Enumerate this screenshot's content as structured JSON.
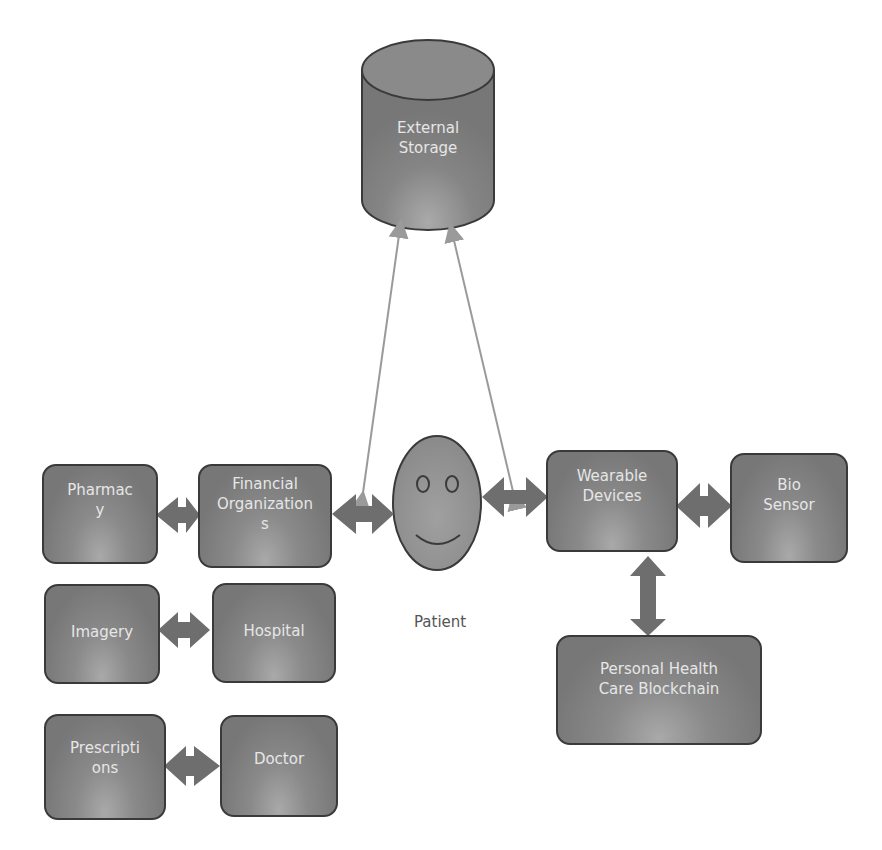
{
  "diagram": {
    "storage": {
      "label": "External\nStorage"
    },
    "patient": {
      "label": "Patient"
    },
    "nodes": {
      "pharmacy": "Pharmac\ny",
      "financial": "Financial\nOrganization\ns",
      "wearable": "Wearable\nDevices",
      "biosensor": "Bio\nSensor",
      "blockchain": "Personal Health\nCare Blockchain",
      "imagery": "Imagery",
      "hospital": "Hospital",
      "prescriptions": "Prescripti\nons",
      "doctor": "Doctor"
    },
    "connections": [
      [
        "pharmacy",
        "financial"
      ],
      [
        "financial",
        "patient"
      ],
      [
        "patient",
        "wearable"
      ],
      [
        "wearable",
        "biosensor"
      ],
      [
        "wearable",
        "blockchain"
      ],
      [
        "imagery",
        "hospital"
      ],
      [
        "prescriptions",
        "doctor"
      ],
      [
        "patient",
        "storage"
      ],
      [
        "storage",
        "patient"
      ]
    ],
    "colors": {
      "node_fill": "#7f7f7f",
      "arrow_fill": "#6e6e6e",
      "thin_arrow": "#9a9a9a",
      "text": "#e6e6e6"
    }
  }
}
